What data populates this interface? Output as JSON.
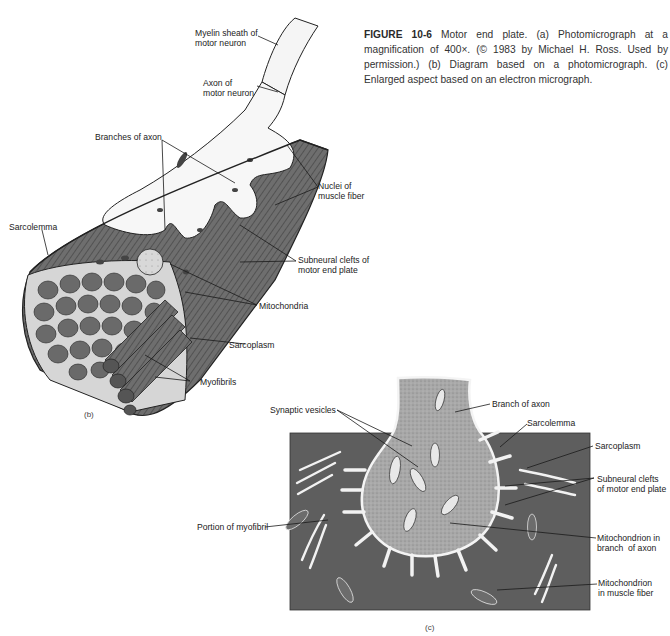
{
  "caption": {
    "figure_number": "FIGURE 10-6",
    "text": " Motor end plate. (a) Photomicrograph at a magnification of 400×. (© 1983 by Michael H. Ross. Used by permission.) (b) Diagram based on a photomicrograph. (c) Enlarged aspect based on an electron micrograph."
  },
  "panel_b": {
    "tag": "(b)",
    "labels": {
      "myelin_sheath": "Myelin sheath of\nmotor neuron",
      "axon": "Axon of\nmotor neuron",
      "branches_of_axon": "Branches of axon",
      "nuclei": "Nuclei of\nmuscle fiber",
      "sarcolemma": "Sarcolemma",
      "subneural_clefts": "Subneural clefts of\nmotor end plate",
      "mitochondria": "Mitochondria",
      "sarcoplasm": "Sarcoplasm",
      "myofibrils": "Myofibrils"
    }
  },
  "panel_c": {
    "tag": "(c)",
    "labels": {
      "synaptic_vesicles": "Synaptic vesicles",
      "branch_of_axon": "Branch of axon",
      "sarcolemma": "Sarcolemma",
      "sarcoplasm": "Sarcoplasm",
      "subneural_clefts": "Subneural clefts\nof motor end plate",
      "portion_of_myofibril": "Portion of myofibril",
      "mitochondrion_axon": "Mitochondrion in\nbranch  of axon",
      "mitochondrion_muscle": "Mitochondrion\nin muscle fiber"
    }
  },
  "colors": {
    "muscle_dark": "#5e5e5e",
    "axon_stipple": "#9a9a9a",
    "myofibril": "#6a6a6a",
    "text": "#222222"
  }
}
